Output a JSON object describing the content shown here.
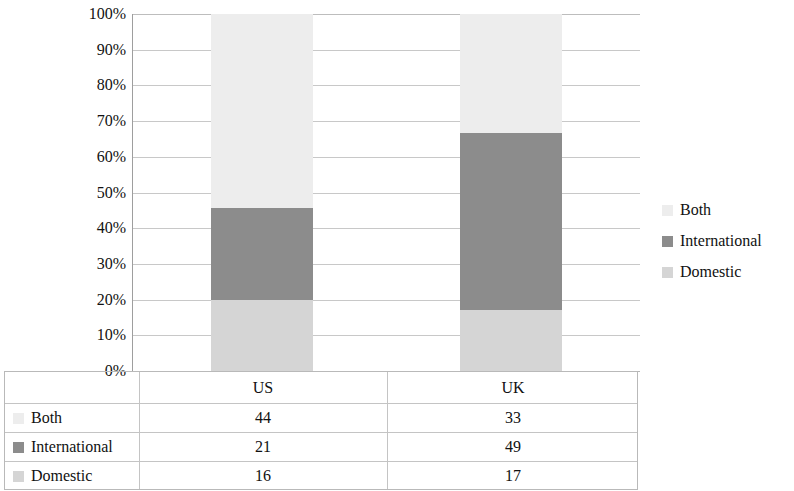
{
  "chart_data": {
    "type": "bar",
    "subtype": "stacked-percent",
    "title": "",
    "xlabel": "",
    "ylabel": "",
    "categories": [
      "US",
      "UK"
    ],
    "series": [
      {
        "name": "Both",
        "values": [
          44,
          33
        ],
        "color": "#ededed"
      },
      {
        "name": "International",
        "values": [
          21,
          49
        ],
        "color": "#8c8c8c"
      },
      {
        "name": "Domestic",
        "values": [
          16,
          17
        ],
        "color": "#d5d5d5"
      }
    ],
    "stack_order_bottom_to_top": [
      "Domestic",
      "International",
      "Both"
    ],
    "totals": [
      81,
      99
    ],
    "percent_segments": {
      "US": {
        "Domestic": 19.8,
        "International": 25.9,
        "Both": 54.3
      },
      "UK": {
        "Domestic": 17.2,
        "International": 49.5,
        "Both": 33.3
      }
    },
    "ylim": [
      0,
      100
    ],
    "ytick_labels": [
      "100%",
      "90%",
      "80%",
      "70%",
      "60%",
      "50%",
      "40%",
      "30%",
      "20%",
      "10%",
      "0%"
    ],
    "ytick_values": [
      100,
      90,
      80,
      70,
      60,
      50,
      40,
      30,
      20,
      10,
      0
    ],
    "grid": true,
    "legend_position": "right",
    "data_table_visible": true
  },
  "legend": {
    "items": [
      {
        "label": "Both",
        "color": "#ededed"
      },
      {
        "label": "International",
        "color": "#8c8c8c"
      },
      {
        "label": "Domestic",
        "color": "#d5d5d5"
      }
    ]
  },
  "table": {
    "column_headers": [
      "",
      "US",
      "UK"
    ],
    "rows": [
      {
        "label": "Both",
        "color": "#ededed",
        "values": [
          "44",
          "33"
        ]
      },
      {
        "label": "International",
        "color": "#8c8c8c",
        "values": [
          "21",
          "49"
        ]
      },
      {
        "label": "Domestic",
        "color": "#d5d5d5",
        "values": [
          "16",
          "17"
        ]
      }
    ]
  }
}
